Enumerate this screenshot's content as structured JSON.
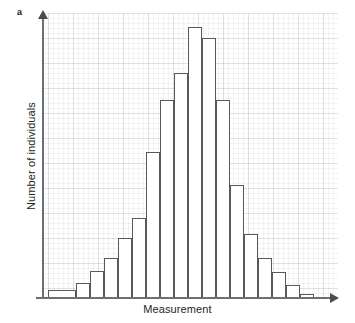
{
  "figure": {
    "panel_letter": "a",
    "xlabel": "Measurement",
    "ylabel": "Number of individuals",
    "bar_fill": "#ffffff",
    "bar_stroke": "#58595c",
    "axis_color": "#6d6f73",
    "grid_color": "#e8eaec",
    "background": "#ffffff"
  },
  "chart_data": {
    "type": "bar",
    "title": "",
    "subtitle": "",
    "xlabel": "Measurement",
    "ylabel": "Number of individuals",
    "annotations": [
      "a"
    ],
    "legend": [],
    "grid": true,
    "axis_ticks_shown": false,
    "axis_arrows": true,
    "xlim": [
      0,
      16
    ],
    "ylim": [
      0,
      100
    ],
    "categories": [
      "1",
      "2",
      "3",
      "4",
      "5",
      "6",
      "7",
      "8",
      "9",
      "10",
      "11",
      "12",
      "13",
      "14",
      "15",
      "16"
    ],
    "values": [
      3,
      8,
      18,
      28,
      43,
      65,
      82,
      95,
      93,
      72,
      40,
      23,
      14,
      9,
      5,
      1
    ],
    "bars": [
      {
        "index": 1,
        "x": 48,
        "width": 28,
        "top": 290,
        "height": 8,
        "value": 3
      },
      {
        "index": 2,
        "x": 76,
        "width": 14,
        "top": 283,
        "height": 15,
        "value": 8
      },
      {
        "index": 3,
        "x": 90,
        "width": 14,
        "top": 271,
        "height": 27,
        "value": 18
      },
      {
        "index": 4,
        "x": 104,
        "width": 14,
        "top": 258,
        "height": 40,
        "value": 28
      },
      {
        "index": 5,
        "x": 118,
        "width": 14,
        "top": 238,
        "height": 60,
        "value": 43
      },
      {
        "index": 6,
        "x": 132,
        "width": 14,
        "top": 218,
        "height": 80,
        "value": 55
      },
      {
        "index": 7,
        "x": 146,
        "width": 14,
        "top": 152,
        "height": 146,
        "value": 72
      },
      {
        "index": 8,
        "x": 160,
        "width": 14,
        "top": 100,
        "height": 198,
        "value": 82
      },
      {
        "index": 9,
        "x": 174,
        "width": 14,
        "top": 73,
        "height": 225,
        "value": 88
      },
      {
        "index": 10,
        "x": 188,
        "width": 14,
        "top": 27,
        "height": 271,
        "value": 100
      },
      {
        "index": 11,
        "x": 202,
        "width": 14,
        "top": 38,
        "height": 260,
        "value": 96
      },
      {
        "index": 12,
        "x": 216,
        "width": 14,
        "top": 100,
        "height": 198,
        "value": 82
      },
      {
        "index": 13,
        "x": 230,
        "width": 14,
        "top": 185,
        "height": 113,
        "value": 62
      },
      {
        "index": 14,
        "x": 244,
        "width": 14,
        "top": 234,
        "height": 64,
        "value": 42
      },
      {
        "index": 15,
        "x": 258,
        "width": 14,
        "top": 258,
        "height": 40,
        "value": 28
      },
      {
        "index": 16,
        "x": 272,
        "width": 14,
        "top": 272,
        "height": 26,
        "value": 18
      },
      {
        "index": 17,
        "x": 286,
        "width": 14,
        "top": 285,
        "height": 13,
        "value": 8
      },
      {
        "index": 18,
        "x": 300,
        "width": 14,
        "top": 294,
        "height": 4,
        "value": 2
      }
    ]
  }
}
